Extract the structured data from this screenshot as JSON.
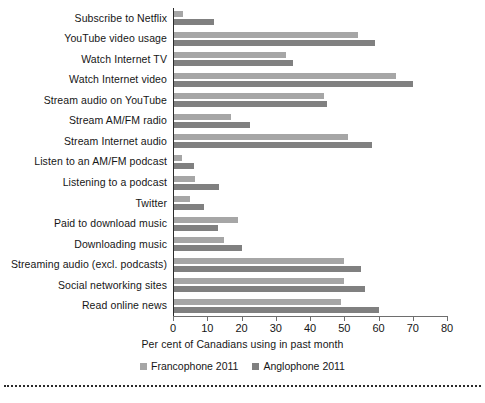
{
  "chart_data": {
    "type": "bar",
    "orientation": "horizontal",
    "title": "",
    "xlabel": "Per cent of Canadians using in past month",
    "ylabel": "",
    "xlim": [
      0,
      80
    ],
    "xticks": [
      0,
      10,
      20,
      30,
      40,
      50,
      60,
      70,
      80
    ],
    "grid": false,
    "legend_position": "bottom",
    "categories": [
      "Subscribe to Netflix",
      "YouTube video usage",
      "Watch Internet TV",
      "Watch Internet video",
      "Stream audio on YouTube",
      "Stream AM/FM radio",
      "Stream Internet audio",
      "Listen to an AM/FM podcast",
      "Listening to a podcast",
      "Twitter",
      "Paid to download music",
      "Downloading music",
      "Streaming audio (excl. podcasts)",
      "Social networking sites",
      "Read online news"
    ],
    "series": [
      {
        "name": "Francophone 2011",
        "color": "#a6a6a6",
        "values": [
          3,
          54,
          33,
          65,
          44,
          17,
          51,
          2.5,
          6.5,
          5,
          19,
          15,
          50,
          50,
          49
        ]
      },
      {
        "name": "Anglophone 2011",
        "color": "#808080",
        "values": [
          12,
          59,
          35,
          70,
          45,
          22.5,
          58,
          6,
          13.5,
          9,
          13,
          20,
          55,
          56,
          60
        ]
      }
    ]
  },
  "axis": {
    "tick_labels": [
      "0",
      "10",
      "20",
      "30",
      "40",
      "50",
      "60",
      "70",
      "80"
    ],
    "title": "Per cent of Canadians using in past month"
  },
  "legend": {
    "items": [
      {
        "label": "Francophone 2011"
      },
      {
        "label": "Anglophone 2011"
      }
    ]
  }
}
